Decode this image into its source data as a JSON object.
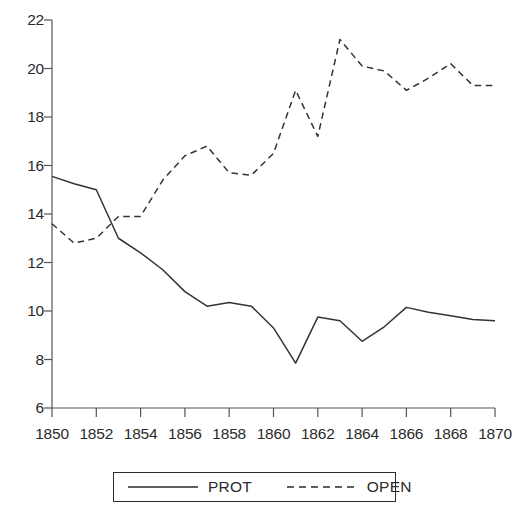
{
  "chart_data": {
    "type": "line",
    "title": "",
    "subtitle": "",
    "xlabel": "",
    "ylabel": "",
    "xlim": [
      1850,
      1870
    ],
    "ylim": [
      6,
      22
    ],
    "grid": false,
    "legend_position": "bottom",
    "x": [
      1850,
      1851,
      1852,
      1853,
      1854,
      1855,
      1856,
      1857,
      1858,
      1859,
      1860,
      1861,
      1862,
      1863,
      1864,
      1865,
      1866,
      1867,
      1868,
      1869,
      1870
    ],
    "x_tick_labels": [
      "1850",
      "1852",
      "1854",
      "1856",
      "1858",
      "1860",
      "1862",
      "1864",
      "1866",
      "1868",
      "1870"
    ],
    "x_ticks": [
      1850,
      1852,
      1854,
      1856,
      1858,
      1860,
      1862,
      1864,
      1866,
      1868,
      1870
    ],
    "y_tick_labels": [
      "6",
      "8",
      "10",
      "12",
      "14",
      "16",
      "18",
      "20",
      "22"
    ],
    "y_ticks": [
      6,
      8,
      10,
      12,
      14,
      16,
      18,
      20,
      22
    ],
    "series": [
      {
        "name": "PROT",
        "style": "solid",
        "color": "#333333",
        "values": [
          15.55,
          15.25,
          15.0,
          13.0,
          12.4,
          11.7,
          10.8,
          10.2,
          10.35,
          10.2,
          9.3,
          7.85,
          9.75,
          9.6,
          8.75,
          9.35,
          10.15,
          9.95,
          9.8,
          9.65,
          9.6
        ]
      },
      {
        "name": "OPEN",
        "style": "dashed",
        "color": "#333333",
        "values": [
          13.6,
          12.8,
          13.0,
          13.9,
          13.9,
          15.4,
          16.4,
          16.8,
          15.7,
          15.6,
          16.5,
          19.1,
          17.2,
          21.2,
          20.1,
          19.9,
          19.1,
          19.6,
          20.2,
          19.3,
          19.3
        ]
      }
    ]
  },
  "legend": {
    "entries": [
      {
        "label": "PROT",
        "style": "solid"
      },
      {
        "label": "OPEN",
        "style": "dashed"
      }
    ]
  },
  "axes": {
    "axis_color": "#555555",
    "tick_color": "#555555"
  }
}
